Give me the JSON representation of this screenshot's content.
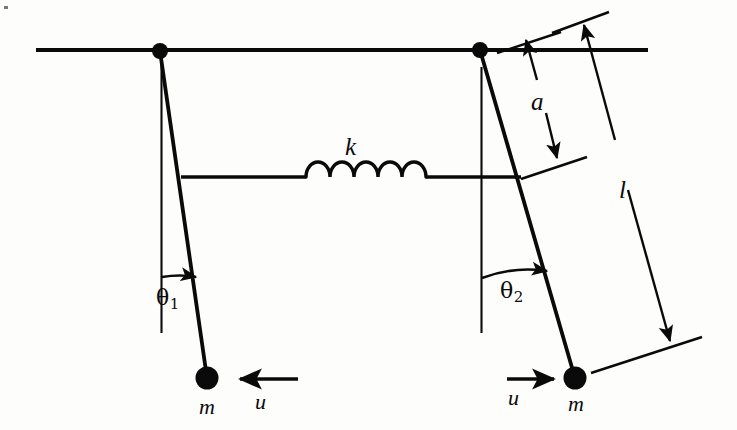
{
  "figure": {
    "type": "physics-diagram",
    "background_color": "#fdfdfc",
    "ink_color": "#0a0a0a"
  },
  "labels": {
    "spring_constant": "k",
    "spring_attach_distance": "a",
    "pendulum_length": "l",
    "mass_left": "m",
    "mass_right": "m",
    "velocity_left": "u",
    "velocity_right": "u",
    "angle_left_symbol": "θ",
    "angle_left_sub": "1",
    "angle_right_symbol": "θ",
    "angle_right_sub": "2"
  },
  "geometry": {
    "ceiling_line": {
      "x1": 36,
      "y1": 50,
      "x2": 648,
      "y2": 50
    },
    "pivot_left": {
      "cx": 160,
      "cy": 51,
      "r": 8
    },
    "pivot_right": {
      "cx": 480,
      "cy": 50,
      "r": 8
    },
    "rod_left": {
      "x1": 160,
      "y1": 51,
      "x2": 207,
      "y2": 378
    },
    "rod_right": {
      "x1": 480,
      "y1": 50,
      "x2": 575,
      "y2": 378
    },
    "bob_left": {
      "cx": 207,
      "cy": 378,
      "r": 11
    },
    "bob_right": {
      "cx": 575,
      "cy": 378,
      "r": 11
    },
    "vertical_ref_left": {
      "x1": 161,
      "y1": 56,
      "x2": 161,
      "y2": 332
    },
    "vertical_ref_right": {
      "x1": 481,
      "y1": 68,
      "x2": 481,
      "y2": 332
    },
    "spring_line": {
      "x1": 181,
      "y": 177,
      "x2": 521
    },
    "spring_coil": {
      "start_x": 305,
      "end_x": 425,
      "coils": 5,
      "amplitude": 17
    },
    "arrow_u_left": {
      "x1": 297,
      "y1": 379,
      "x2": 238,
      "y2": 379,
      "direction": "left"
    },
    "arrow_u_right": {
      "x1": 507,
      "y1": 379,
      "x2": 556,
      "y2": 379,
      "direction": "right"
    },
    "angle_arc_left": {
      "cx": 161,
      "cy": 51,
      "r": 226,
      "tip_x": 196,
      "tip_y": 277
    },
    "angle_arc_right": {
      "cx": 481,
      "cy": 50,
      "r": 228,
      "tip_x": 546,
      "tip_y": 271
    },
    "dim_a": {
      "x1": 525,
      "y1": 38,
      "x2": 558,
      "y2": 160,
      "both_arrows": true
    },
    "dim_l": {
      "x1": 582,
      "y1": 22,
      "x2": 672,
      "y2": 344,
      "both_arrows": true
    },
    "tick_a_top": {
      "x1": 497,
      "y1": 53,
      "x2": 560,
      "y2": 33
    },
    "tick_a_bottom": {
      "x1": 521,
      "y1": 179,
      "x2": 586,
      "y2": 158
    },
    "tick_l_top": {
      "x1": 553,
      "y1": 32,
      "x2": 608,
      "y2": 12
    },
    "tick_l_bottom": {
      "x1": 592,
      "y1": 372,
      "x2": 701,
      "y2": 338
    }
  },
  "label_positions": {
    "k": {
      "x": 345,
      "y": 134
    },
    "a": {
      "x": 531,
      "y": 89
    },
    "l": {
      "x": 619,
      "y": 177
    },
    "m_left": {
      "x": 199,
      "y": 396
    },
    "m_right": {
      "x": 569,
      "y": 393
    },
    "u_left": {
      "x": 254,
      "y": 391
    },
    "u_right": {
      "x": 508,
      "y": 387
    },
    "theta_left": {
      "x": 156,
      "y": 287
    },
    "theta_right": {
      "x": 500,
      "y": 280
    }
  }
}
